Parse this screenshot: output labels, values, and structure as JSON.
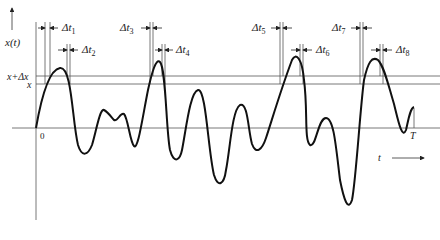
{
  "figure": {
    "y_axis_label": "x(t)",
    "x_axis_label": "t",
    "origin_label": "0",
    "end_label": "T",
    "level_upper_label": "x+Δx",
    "level_lower_label": "x",
    "intervals": [
      {
        "name": "Δt",
        "index": "1"
      },
      {
        "name": "Δt",
        "index": "2"
      },
      {
        "name": "Δt",
        "index": "3"
      },
      {
        "name": "Δt",
        "index": "4"
      },
      {
        "name": "Δt",
        "index": "5"
      },
      {
        "name": "Δt",
        "index": "6"
      },
      {
        "name": "Δt",
        "index": "7"
      },
      {
        "name": "Δt",
        "index": "8"
      }
    ],
    "colors": {
      "line": "#1a1a1a",
      "thin": "#555555",
      "background": "#ffffff"
    }
  }
}
